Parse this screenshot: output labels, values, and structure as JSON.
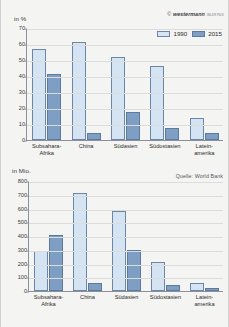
{
  "page": {
    "background": "#f4f4f2",
    "colors": {
      "series_1990": "#d5e4f3",
      "series_2015": "#7e9ec4",
      "axis": "#8d9098",
      "grid": "#dcdcdc"
    }
  },
  "credit": {
    "symbol": "©",
    "brand": "westermann",
    "code": "364976X"
  },
  "source": {
    "label": "Quelle: World Bank"
  },
  "legend": {
    "items": [
      {
        "label": "1990",
        "color": "#d5e4f3"
      },
      {
        "label": "2015",
        "color": "#7e9ec4"
      }
    ]
  },
  "chart_data": [
    {
      "id": "poverty-share",
      "type": "bar",
      "title": "",
      "xlabel": "",
      "ylabel": "in %",
      "ylim": [
        0,
        70
      ],
      "yticks": [
        0,
        10,
        20,
        30,
        40,
        50,
        60,
        70
      ],
      "grid": true,
      "legend_position": "top-right",
      "categories": [
        "Subsahara-\nAfrika",
        "China",
        "Südasien",
        "Südostasien",
        "Latein-\namerika"
      ],
      "category_lines": [
        [
          "Subsahara-",
          "Afrika"
        ],
        [
          "China",
          ""
        ],
        [
          "Südasien",
          ""
        ],
        [
          "Südostasien",
          ""
        ],
        [
          "Latein-",
          "amerika"
        ]
      ],
      "series": [
        {
          "name": "1990",
          "values": [
            57,
            61,
            52,
            46.5,
            13.5
          ]
        },
        {
          "name": "2015",
          "values": [
            41,
            4.5,
            17.5,
            7.5,
            4.5
          ]
        }
      ]
    },
    {
      "id": "poverty-absolute",
      "type": "bar",
      "title": "",
      "xlabel": "",
      "ylabel": "in Mio.",
      "ylim": [
        0,
        800
      ],
      "yticks": [
        0,
        100,
        200,
        300,
        400,
        500,
        600,
        700,
        800
      ],
      "grid": true,
      "legend_position": "none",
      "categories": [
        "Subsahara-\nAfrika",
        "China",
        "Südasien",
        "Südostasien",
        "Latein-\namerika"
      ],
      "category_lines": [
        [
          "Subsahara-",
          "Afrika"
        ],
        [
          "China",
          ""
        ],
        [
          "Südasien",
          ""
        ],
        [
          "Südostasien",
          ""
        ],
        [
          "Latein-",
          "amerika"
        ]
      ],
      "series": [
        {
          "name": "1990",
          "values": [
            290,
            710,
            585,
            208,
            57
          ]
        },
        {
          "name": "2015",
          "values": [
            410,
            55,
            295,
            47,
            25
          ]
        }
      ]
    }
  ]
}
